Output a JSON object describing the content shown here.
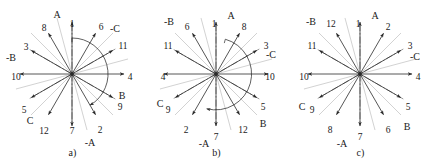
{
  "figure": {
    "panel_count": 3,
    "colors": {
      "ink": "#1a1a1a",
      "ray": "#2b2b2b",
      "dashdot": "#555555",
      "background": "#ffffff"
    }
  },
  "panels": [
    {
      "id": "a",
      "caption": "a)",
      "center": {
        "x": 72,
        "y": 74
      },
      "arc": {
        "radius": 36,
        "start_deg": 90,
        "end_deg": -60,
        "sweep": "clockwise"
      },
      "axes": [
        {
          "name": "up-axis",
          "label": "1",
          "angle_deg": 90,
          "label_x": 72,
          "label_y": 24
        },
        {
          "name": "down-axis",
          "label": "7",
          "angle_deg": -90,
          "label_x": 72,
          "label_y": 131
        },
        {
          "name": "left-axis",
          "label": "10",
          "angle_deg": 180,
          "label_x": 16,
          "label_y": 77
        },
        {
          "name": "right-axis",
          "label": "4",
          "angle_deg": 0,
          "label_x": 130,
          "label_y": 77
        }
      ],
      "rays": [
        {
          "label": "1",
          "angle_deg": 90,
          "label_x": 72,
          "label_y": 24
        },
        {
          "label": "6",
          "angle_deg": 60,
          "label_x": 101,
          "label_y": 27
        },
        {
          "label": "11",
          "angle_deg": 30,
          "label_x": 123,
          "label_y": 46
        },
        {
          "label": "4",
          "angle_deg": 0,
          "label_x": 130,
          "label_y": 77
        },
        {
          "label": "9",
          "angle_deg": -30,
          "label_x": 120,
          "label_y": 107
        },
        {
          "label": "2",
          "angle_deg": -60,
          "label_x": 100,
          "label_y": 130
        },
        {
          "label": "7",
          "angle_deg": -90,
          "label_x": 72,
          "label_y": 131
        },
        {
          "label": "12",
          "angle_deg": -120,
          "label_x": 44,
          "label_y": 131
        },
        {
          "label": "5",
          "angle_deg": -150,
          "label_x": 24,
          "label_y": 110
        },
        {
          "label": "10",
          "angle_deg": 180,
          "label_x": 16,
          "label_y": 77
        },
        {
          "label": "3",
          "angle_deg": 150,
          "label_x": 26,
          "label_y": 47
        },
        {
          "label": "8",
          "angle_deg": 120,
          "label_x": 44,
          "label_y": 28
        }
      ],
      "phases": [
        {
          "label": "A",
          "x": 57,
          "y": 15
        },
        {
          "label": "-C",
          "x": 115,
          "y": 29
        },
        {
          "label": "B",
          "x": 122,
          "y": 96
        },
        {
          "label": "-A",
          "x": 90,
          "y": 143
        },
        {
          "label": "C",
          "x": 30,
          "y": 121
        },
        {
          "label": "-B",
          "x": 11,
          "y": 58
        }
      ]
    },
    {
      "id": "b",
      "caption": "b)",
      "center": {
        "x": 216,
        "y": 74
      },
      "arc": {
        "radius": 36,
        "start_deg": 75,
        "end_deg": -105,
        "sweep": "clockwise"
      },
      "axes": [
        {
          "name": "up-axis",
          "label": "1",
          "angle_deg": 90,
          "label_x": 214,
          "label_y": 24
        },
        {
          "name": "down-axis",
          "label": "7",
          "angle_deg": -90,
          "label_x": 216,
          "label_y": 137
        },
        {
          "name": "left-axis",
          "label": "4",
          "angle_deg": 180,
          "label_x": 163,
          "label_y": 77
        },
        {
          "name": "right-axis",
          "label": "10",
          "angle_deg": 0,
          "label_x": 270,
          "label_y": 77
        }
      ],
      "rays": [
        {
          "label": "1",
          "angle_deg": 90,
          "label_x": 214,
          "label_y": 24
        },
        {
          "label": "8",
          "angle_deg": 60,
          "label_x": 244,
          "label_y": 27
        },
        {
          "label": "3",
          "angle_deg": 30,
          "label_x": 266,
          "label_y": 46
        },
        {
          "label": "10",
          "angle_deg": 0,
          "label_x": 270,
          "label_y": 77
        },
        {
          "label": "5",
          "angle_deg": -30,
          "label_x": 263,
          "label_y": 107
        },
        {
          "label": "12",
          "angle_deg": -60,
          "label_x": 243,
          "label_y": 130
        },
        {
          "label": "7",
          "angle_deg": -90,
          "label_x": 216,
          "label_y": 137
        },
        {
          "label": "2",
          "angle_deg": -120,
          "label_x": 186,
          "label_y": 130
        },
        {
          "label": "9",
          "angle_deg": -150,
          "label_x": 168,
          "label_y": 110
        },
        {
          "label": "4",
          "angle_deg": 180,
          "label_x": 163,
          "label_y": 77
        },
        {
          "label": "11",
          "angle_deg": 150,
          "label_x": 168,
          "label_y": 46
        },
        {
          "label": "6",
          "angle_deg": 120,
          "label_x": 187,
          "label_y": 27
        }
      ],
      "phases": [
        {
          "label": "A",
          "x": 231,
          "y": 16
        },
        {
          "label": "-C",
          "x": 271,
          "y": 55
        },
        {
          "label": "B",
          "x": 263,
          "y": 124
        },
        {
          "label": "-A",
          "x": 204,
          "y": 144
        },
        {
          "label": "C",
          "x": 160,
          "y": 104
        },
        {
          "label": "-B",
          "x": 169,
          "y": 22
        }
      ]
    },
    {
      "id": "c",
      "caption": "c)",
      "center": {
        "x": 360,
        "y": 74
      },
      "arc": null,
      "axes": [
        {
          "name": "up-axis",
          "label": "1",
          "angle_deg": 90,
          "label_x": 358,
          "label_y": 24
        },
        {
          "name": "down-axis",
          "label": "7",
          "angle_deg": -90,
          "label_x": 360,
          "label_y": 137
        },
        {
          "name": "left-axis",
          "label": "10",
          "angle_deg": 180,
          "label_x": 304,
          "label_y": 77
        },
        {
          "name": "right-axis",
          "label": "4",
          "angle_deg": 0,
          "label_x": 418,
          "label_y": 77
        }
      ],
      "rays": [
        {
          "label": "1",
          "angle_deg": 90,
          "label_x": 358,
          "label_y": 24
        },
        {
          "label": "2",
          "angle_deg": 60,
          "label_x": 388,
          "label_y": 27
        },
        {
          "label": "3",
          "angle_deg": 30,
          "label_x": 410,
          "label_y": 46
        },
        {
          "label": "4",
          "angle_deg": 0,
          "label_x": 418,
          "label_y": 77
        },
        {
          "label": "5",
          "angle_deg": -30,
          "label_x": 408,
          "label_y": 107
        },
        {
          "label": "6",
          "angle_deg": -60,
          "label_x": 388,
          "label_y": 130
        },
        {
          "label": "7",
          "angle_deg": -90,
          "label_x": 360,
          "label_y": 137
        },
        {
          "label": "8",
          "angle_deg": -120,
          "label_x": 330,
          "label_y": 130
        },
        {
          "label": "9",
          "angle_deg": -150,
          "label_x": 312,
          "label_y": 110
        },
        {
          "label": "10",
          "angle_deg": 180,
          "label_x": 304,
          "label_y": 77
        },
        {
          "label": "11",
          "angle_deg": 150,
          "label_x": 312,
          "label_y": 46
        },
        {
          "label": "12",
          "angle_deg": 120,
          "label_x": 331,
          "label_y": 24
        }
      ],
      "phases": [
        {
          "label": "A",
          "x": 375,
          "y": 16
        },
        {
          "label": "-C",
          "x": 415,
          "y": 57
        },
        {
          "label": "B",
          "x": 407,
          "y": 127
        },
        {
          "label": "-A",
          "x": 342,
          "y": 144
        },
        {
          "label": "C",
          "x": 302,
          "y": 107
        },
        {
          "label": "-B",
          "x": 311,
          "y": 22
        }
      ]
    }
  ]
}
